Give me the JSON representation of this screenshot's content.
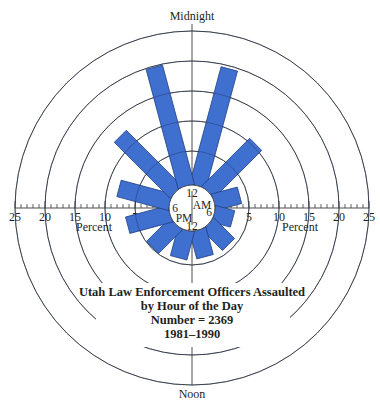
{
  "chart_data": {
    "type": "polar-bar",
    "title": "Utah Law Enforcement Officers Assaulted by Hour of the Day",
    "subtitle_lines": [
      "Utah Law Enforcement Officers Assaulted",
      "by Hour of the Day",
      "Number = 2369",
      "1981–1990"
    ],
    "number": 2369,
    "years": "1981–1990",
    "top_label": "Midnight",
    "bottom_label": "Noon",
    "hub_labels": {
      "top": "12",
      "bottom": "12",
      "left": "6",
      "right": "6",
      "am": "AM",
      "pm": "PM"
    },
    "radial_axis_label": "Percent",
    "radial_ticks": [
      5,
      10,
      15,
      20,
      25
    ],
    "radial_range": [
      0,
      25
    ],
    "bin_hours": 2,
    "categories": [
      "12–2 AM",
      "2–4 AM",
      "4–6 AM",
      "6–8 AM",
      "8–10 AM",
      "10 AM–12 PM",
      "12–2 PM",
      "2–4 PM",
      "4–6 PM",
      "6–8 PM",
      "8–10 PM",
      "10 PM–12 AM"
    ],
    "values": [
      19.5,
      10.5,
      3.7,
      2.5,
      4.1,
      3.9,
      4.1,
      4.8,
      6.6,
      8.1,
      12.4,
      19.8
    ],
    "bar_color": "#3f6fcf",
    "bar_edge_color": "#1f3f80"
  },
  "labels": {
    "top": "Midnight",
    "bottom": "Noon",
    "percent_left": "Percent",
    "percent_right": "Percent",
    "title_line1": "Utah Law Enforcement Officers Assaulted",
    "title_line2": "by Hour of the Day",
    "title_line3": "Number = 2369",
    "title_line4": "1981–1990"
  }
}
